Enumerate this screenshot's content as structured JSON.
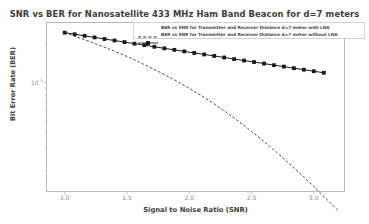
{
  "chart_data": {
    "type": "line",
    "title": "SNR vs BER for Nanosatellite 433 MHz Ham Band Beacon for d=7 meters",
    "xlabel": "Signal to Noise Ratio (SNR)",
    "ylabel": "Bit Error Rate (BER)",
    "yscale": "log",
    "xlim": [
      0.85,
      3.25
    ],
    "ylim": [
      0.0135,
      0.3
    ],
    "grid": false,
    "legend_position": "top-right",
    "xticks": [
      "1.0",
      "1.5",
      "2.0",
      "2.5",
      "3.0"
    ],
    "xtick_values": [
      1.0,
      1.5,
      2.0,
      2.5,
      3.0
    ],
    "yticks": [
      {
        "label_mantissa": "10",
        "label_exponent": "-1",
        "value": 0.1
      }
    ],
    "series": [
      {
        "name": "BER vs SNR for Transmitter and Receiver Distance d=7 meter with LNA",
        "style": "dashed",
        "marker": "none",
        "color": "#1a1a1a",
        "x": [
          1.0,
          1.1,
          1.2,
          1.3,
          1.4,
          1.5,
          1.6,
          1.7,
          1.8,
          1.9,
          2.0,
          2.1,
          2.2,
          2.3,
          2.4,
          2.5,
          2.6,
          2.7,
          2.8,
          2.9,
          3.0,
          3.1,
          3.2
        ],
        "y": [
          0.247,
          0.228,
          0.21,
          0.193,
          0.176,
          0.16,
          0.144,
          0.129,
          0.115,
          0.102,
          0.0895,
          0.078,
          0.0673,
          0.0575,
          0.0487,
          0.0408,
          0.0339,
          0.0279,
          0.0228,
          0.0185,
          0.0149,
          0.0119,
          0.0095
        ]
      },
      {
        "name": "BER vs SNR for Transmitter and Receiver Distance d=7 meter without LNA",
        "style": "solid",
        "marker": "square",
        "color": "#1a1a1a",
        "x": [
          1.0,
          1.08,
          1.16,
          1.24,
          1.32,
          1.4,
          1.48,
          1.56,
          1.64,
          1.72,
          1.8,
          1.88,
          1.96,
          2.04,
          2.12,
          2.2,
          2.28,
          2.36,
          2.44,
          2.52,
          2.6,
          2.68,
          2.76,
          2.84,
          2.92,
          3.0,
          3.08
        ],
        "y": [
          0.247,
          0.24,
          0.233,
          0.2265,
          0.22,
          0.214,
          0.208,
          0.202,
          0.1965,
          0.191,
          0.1855,
          0.1805,
          0.1755,
          0.1705,
          0.166,
          0.1615,
          0.157,
          0.1525,
          0.1485,
          0.1445,
          0.1405,
          0.1365,
          0.133,
          0.1292,
          0.1257,
          0.1222,
          0.1188
        ]
      }
    ]
  }
}
